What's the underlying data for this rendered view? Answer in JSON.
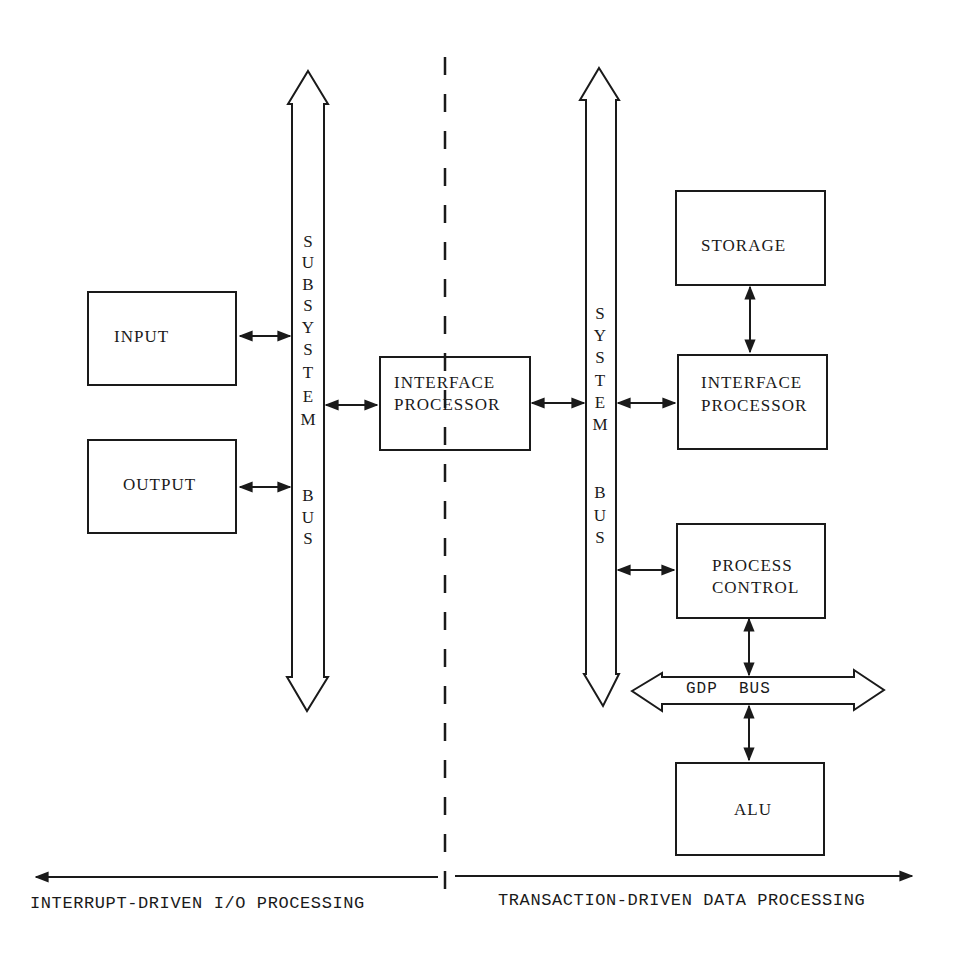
{
  "diagram": {
    "type": "block-diagram",
    "colors": {
      "ink": "#1a1a1a",
      "background": "#ffffff"
    },
    "divider": {
      "style": "dashed",
      "x": 447
    },
    "buses": {
      "subsystem_bus": {
        "label": "SUBSYSTEM BUS",
        "letters_top": [
          "S",
          "U",
          "B",
          "S",
          "Y",
          "S",
          "T",
          "E",
          "M"
        ],
        "letters_bottom": [
          "B",
          "U",
          "S"
        ],
        "orientation": "vertical",
        "direction": "bidirectional"
      },
      "system_bus": {
        "label": "SYSTEM BUS",
        "letters_top": [
          "S",
          "Y",
          "S",
          "T",
          "E",
          "M"
        ],
        "letters_bottom": [
          "B",
          "U",
          "S"
        ],
        "orientation": "vertical",
        "direction": "bidirectional"
      },
      "gdp_bus": {
        "label": "GDP  BUS",
        "orientation": "horizontal",
        "direction": "bidirectional"
      }
    },
    "blocks": {
      "input": {
        "label": "INPUT"
      },
      "output": {
        "label": "OUTPUT"
      },
      "interface_processor_center": {
        "line1": "INTERFACE",
        "line2": "PROCESSOR"
      },
      "storage": {
        "label": "STORAGE"
      },
      "interface_processor_right": {
        "line1": "INTERFACE",
        "line2": "PROCESSOR"
      },
      "process_control": {
        "line1": "PROCESS",
        "line2": "CONTROL"
      },
      "alu": {
        "label": "ALU"
      }
    },
    "connections": [
      {
        "from": "input",
        "to": "subsystem_bus",
        "type": "bidirectional"
      },
      {
        "from": "output",
        "to": "subsystem_bus",
        "type": "bidirectional"
      },
      {
        "from": "subsystem_bus",
        "to": "interface_processor_center",
        "type": "bidirectional"
      },
      {
        "from": "interface_processor_center",
        "to": "system_bus",
        "type": "bidirectional"
      },
      {
        "from": "system_bus",
        "to": "interface_processor_right",
        "type": "bidirectional"
      },
      {
        "from": "storage",
        "to": "interface_processor_right",
        "type": "bidirectional"
      },
      {
        "from": "system_bus",
        "to": "process_control",
        "type": "bidirectional"
      },
      {
        "from": "process_control",
        "to": "gdp_bus",
        "type": "bidirectional"
      },
      {
        "from": "gdp_bus",
        "to": "alu",
        "type": "bidirectional"
      }
    ],
    "axis": {
      "left_label": "INTERRUPT-DRIVEN I/O PROCESSING",
      "right_label": "TRANSACTION-DRIVEN DATA PROCESSING"
    }
  }
}
